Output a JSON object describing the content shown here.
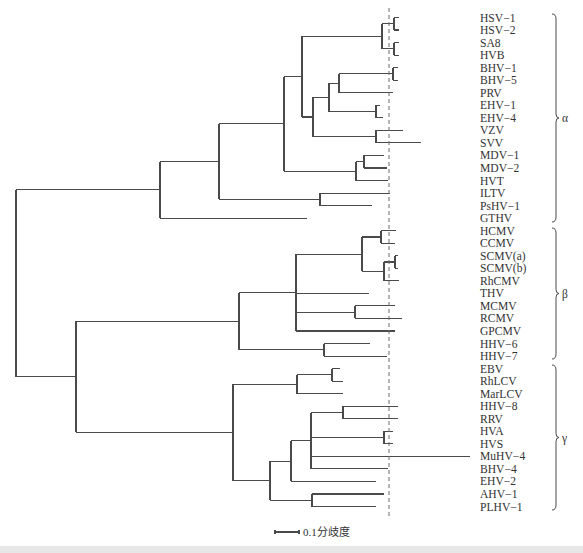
{
  "figure": {
    "type": "phylogenetic-tree",
    "row_start_y": 17.5,
    "row_spacing": 12.54,
    "label_x": 480,
    "line_color": "#4a4a4a",
    "cutoff_line": {
      "x": 389,
      "y_top": 8,
      "y_bottom": 518,
      "style": "dashed"
    }
  },
  "leaves": [
    "HSV−1",
    "HSV−2",
    "SA8",
    "HVB",
    "BHV−1",
    "BHV−5",
    "PRV",
    "EHV−1",
    "EHV−4",
    "VZV",
    "SVV",
    "MDV−1",
    "MDV−2",
    "HVT",
    "ILTV",
    "PsHV−1",
    "GTHV",
    "HCMV",
    "CCMV",
    "SCMV(a)",
    "SCMV(b)",
    "RhCMV",
    "THV",
    "MCMV",
    "RCMV",
    "GPCMV",
    "HHV−6",
    "HHV−7",
    "EBV",
    "RhLCV",
    "MarLCV",
    "HHV−8",
    "RRV",
    "HVA",
    "HVS",
    "MuHV−4",
    "BHV−4",
    "EHV−2",
    "AHV−1",
    "PLHV−1"
  ],
  "clades": [
    {
      "label": "α",
      "from_y": 14,
      "to_y": 222
    },
    {
      "label": "β",
      "from_y": 228,
      "to_y": 359
    },
    {
      "label": "γ",
      "from_y": 365,
      "to_y": 510
    }
  ],
  "scale_bar": {
    "label": "0.1分歧度",
    "x1": 275,
    "x2": 299,
    "y": 532
  },
  "tree": {
    "x": 16,
    "c": [
      {
        "x": 160,
        "c": [
          {
            "x": 219,
            "c": [
              {
                "x": 284,
                "c": [
                  {
                    "x": 302,
                    "c": [
                      {
                        "x": 382,
                        "c": [
                          {
                            "x": 394,
                            "c": [
                              {
                                "leaf": 0,
                                "tip": 399
                              },
                              {
                                "leaf": 1,
                                "tip": 399
                              }
                            ]
                          },
                          {
                            "x": 394,
                            "c": [
                              {
                                "leaf": 2,
                                "tip": 399
                              },
                              {
                                "leaf": 3,
                                "tip": 399
                              }
                            ]
                          }
                        ]
                      },
                      {
                        "x": 313,
                        "c": [
                          {
                            "x": 329,
                            "c": [
                              {
                                "x": 339,
                                "c": [
                                  {
                                    "x": 393,
                                    "c": [
                                      {
                                        "leaf": 4,
                                        "tip": 398
                                      },
                                      {
                                        "leaf": 5,
                                        "tip": 398
                                      }
                                    ]
                                  },
                                  {
                                    "leaf": 6,
                                    "tip": 393
                                  }
                                ]
                              },
                              {
                                "x": 376,
                                "c": [
                                  {
                                    "leaf": 7,
                                    "tip": 380
                                  },
                                  {
                                    "leaf": 8,
                                    "tip": 383
                                  }
                                ]
                              }
                            ]
                          },
                          {
                            "x": 376,
                            "c": [
                              {
                                "leaf": 9,
                                "tip": 403
                              },
                              {
                                "leaf": 10,
                                "tip": 421
                              }
                            ]
                          }
                        ]
                      }
                    ]
                  },
                  {
                    "x": 356,
                    "c": [
                      {
                        "x": 364,
                        "c": [
                          {
                            "leaf": 11,
                            "tip": 384
                          },
                          {
                            "leaf": 12,
                            "tip": 387
                          }
                        ]
                      },
                      {
                        "leaf": 13,
                        "tip": 388
                      }
                    ]
                  }
                ]
              },
              {
                "x": 320,
                "c": [
                  {
                    "leaf": 14,
                    "tip": 390
                  },
                  {
                    "leaf": 15,
                    "tip": 372
                  }
                ]
              }
            ]
          },
          {
            "leaf": 16,
            "tip": 307
          }
        ]
      },
      {
        "x": 76,
        "c": [
          {
            "x": 239,
            "c": [
              {
                "x": 296,
                "c": [
                  {
                    "x": 362,
                    "c": [
                      {
                        "x": 381,
                        "c": [
                          {
                            "leaf": 17,
                            "tip": 396
                          },
                          {
                            "leaf": 18,
                            "tip": 395
                          }
                        ]
                      },
                      {
                        "x": 384,
                        "c": [
                          {
                            "x": 395,
                            "c": [
                              {
                                "leaf": 19,
                                "tip": 398
                              },
                              {
                                "leaf": 20,
                                "tip": 398
                              }
                            ]
                          },
                          {
                            "leaf": 21,
                            "tip": 399
                          }
                        ]
                      }
                    ]
                  },
                  {
                    "leaf": 22,
                    "tip": 369
                  },
                  {
                    "x": 355,
                    "c": [
                      {
                        "leaf": 23,
                        "tip": 395
                      },
                      {
                        "leaf": 24,
                        "tip": 402
                      }
                    ]
                  },
                  {
                    "leaf": 25,
                    "tip": 395
                  }
                ]
              },
              {
                "x": 324,
                "c": [
                  {
                    "leaf": 26,
                    "tip": 370
                  },
                  {
                    "leaf": 27,
                    "tip": 387
                  }
                ]
              }
            ]
          },
          {
            "x": 233,
            "c": [
              {
                "x": 297,
                "c": [
                  {
                    "x": 332,
                    "c": [
                      {
                        "leaf": 28,
                        "tip": 340
                      },
                      {
                        "leaf": 29,
                        "tip": 343
                      }
                    ]
                  },
                  {
                    "leaf": 30,
                    "tip": 343
                  }
                ]
              },
              {
                "x": 270,
                "c": [
                  {
                    "x": 291,
                    "c": [
                      {
                        "x": 311,
                        "c": [
                          {
                            "x": 343,
                            "c": [
                              {
                                "leaf": 31,
                                "tip": 398
                              },
                              {
                                "leaf": 32,
                                "tip": 398
                              }
                            ]
                          },
                          {
                            "x": 384,
                            "c": [
                              {
                                "leaf": 33,
                                "tip": 393
                              },
                              {
                                "leaf": 34,
                                "tip": 393
                              }
                            ]
                          },
                          {
                            "leaf": 35,
                            "tip": 470
                          },
                          {
                            "leaf": 36,
                            "tip": 388
                          }
                        ]
                      },
                      {
                        "leaf": 37,
                        "tip": 376
                      }
                    ]
                  },
                  {
                    "x": 312,
                    "c": [
                      {
                        "leaf": 38,
                        "tip": 384
                      },
                      {
                        "leaf": 39,
                        "tip": 376
                      }
                    ]
                  }
                ]
              }
            ]
          }
        ]
      }
    ]
  }
}
